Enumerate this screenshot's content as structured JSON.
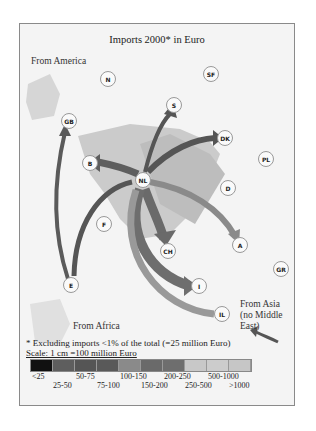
{
  "title": "Imports 2000* in Euro",
  "region_labels": {
    "america": "From America",
    "africa": "From Africa",
    "asia_line1": "From Asia",
    "asia_line2": "(no Middle",
    "asia_line3": "East)"
  },
  "nodes": [
    {
      "code": "N",
      "x": 88,
      "y": 55
    },
    {
      "code": "SF",
      "x": 191,
      "y": 50
    },
    {
      "code": "S",
      "x": 154,
      "y": 81
    },
    {
      "code": "GB",
      "x": 49,
      "y": 97
    },
    {
      "code": "DK",
      "x": 205,
      "y": 114
    },
    {
      "code": "PL",
      "x": 246,
      "y": 135
    },
    {
      "code": "B",
      "x": 70,
      "y": 139
    },
    {
      "code": "NL",
      "x": 123,
      "y": 156
    },
    {
      "code": "D",
      "x": 208,
      "y": 164
    },
    {
      "code": "F",
      "x": 84,
      "y": 200
    },
    {
      "code": "CH",
      "x": 148,
      "y": 227
    },
    {
      "code": "A",
      "x": 220,
      "y": 221
    },
    {
      "code": "GR",
      "x": 261,
      "y": 245
    },
    {
      "code": "E",
      "x": 51,
      "y": 261
    },
    {
      "code": "I",
      "x": 179,
      "y": 262
    },
    {
      "code": "IL",
      "x": 202,
      "y": 290
    }
  ],
  "footnote": "* Excluding imports <1% of the total (=25 million Euro)",
  "scale_text": "Scale: 1 cm =100 million Euro",
  "legend": {
    "colors": [
      "#111111",
      "#5e5e5e",
      "#555555",
      "#595959",
      "#8a8a8a",
      "#6a6a6a",
      "#6e6e6e",
      "#c8c8c8",
      "#cccccc",
      "#c6c6c6"
    ],
    "ticks_top": [
      "<25",
      "50-75",
      "100-150",
      "200-250",
      "500-1000"
    ],
    "ticks_bottom": [
      "25-50",
      "75-100",
      "150-200",
      "250-500",
      ">1000"
    ]
  }
}
